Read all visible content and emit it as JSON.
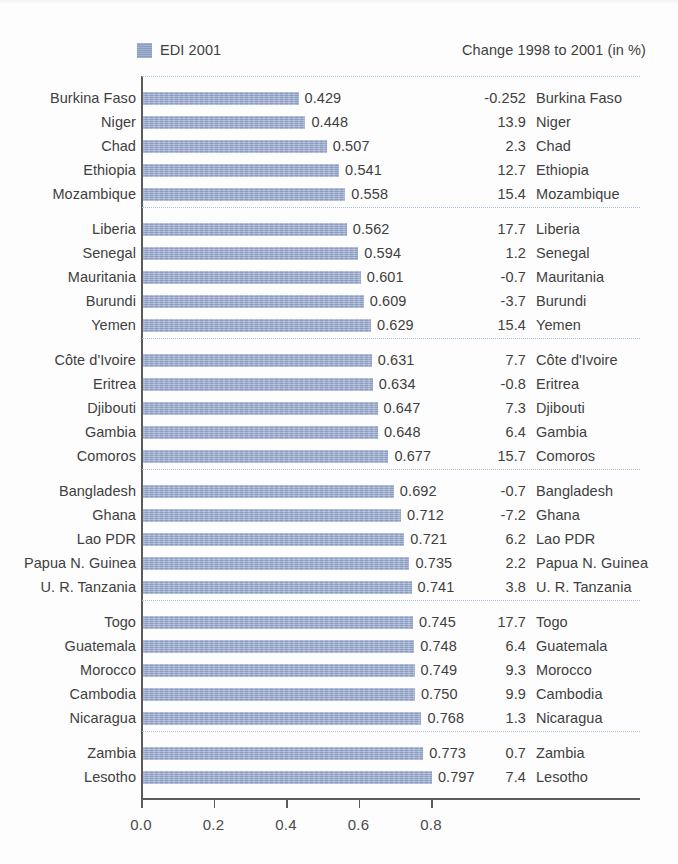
{
  "legend": {
    "label": "EDI 2001",
    "swatch_color": "#8a9cc2",
    "swatch_icon": "legend-square-icon"
  },
  "right_header": "Change 1998 to 2001 (in %)",
  "axis": {
    "ticks": [
      "0.0",
      "0.2",
      "0.4",
      "0.6",
      "0.8"
    ],
    "tick_values": [
      0.0,
      0.2,
      0.4,
      0.6,
      0.8
    ],
    "xmin": 0.0,
    "xmax": 1.0
  },
  "chart_data": {
    "type": "bar",
    "orientation": "horizontal",
    "title": "",
    "xlabel": "",
    "ylabel": "",
    "xlim": [
      0.0,
      1.0
    ],
    "grid": false,
    "legend_position": "top-left",
    "series": [
      {
        "name": "EDI 2001",
        "color": "#8a9cc2"
      }
    ],
    "value_columns": [
      "EDI 2001",
      "Change 1998 to 2001 (in %)"
    ],
    "groups": [
      {
        "rows": [
          {
            "category": "Burkina Faso",
            "value": 0.429,
            "value_label": "0.429",
            "change": -0.252,
            "change_label": "-0.252"
          },
          {
            "category": "Niger",
            "value": 0.448,
            "value_label": "0.448",
            "change": 13.9,
            "change_label": "13.9"
          },
          {
            "category": "Chad",
            "value": 0.507,
            "value_label": "0.507",
            "change": 2.3,
            "change_label": "2.3"
          },
          {
            "category": "Ethiopia",
            "value": 0.541,
            "value_label": "0.541",
            "change": 12.7,
            "change_label": "12.7"
          },
          {
            "category": "Mozambique",
            "value": 0.558,
            "value_label": "0.558",
            "change": 15.4,
            "change_label": "15.4"
          }
        ]
      },
      {
        "rows": [
          {
            "category": "Liberia",
            "value": 0.562,
            "value_label": "0.562",
            "change": 17.7,
            "change_label": "17.7"
          },
          {
            "category": "Senegal",
            "value": 0.594,
            "value_label": "0.594",
            "change": 1.2,
            "change_label": "1.2"
          },
          {
            "category": "Mauritania",
            "value": 0.601,
            "value_label": "0.601",
            "change": -0.7,
            "change_label": "-0.7"
          },
          {
            "category": "Burundi",
            "value": 0.609,
            "value_label": "0.609",
            "change": -3.7,
            "change_label": "-3.7"
          },
          {
            "category": "Yemen",
            "value": 0.629,
            "value_label": "0.629",
            "change": 15.4,
            "change_label": "15.4"
          }
        ]
      },
      {
        "rows": [
          {
            "category": "Côte d'Ivoire",
            "value": 0.631,
            "value_label": "0.631",
            "change": 7.7,
            "change_label": "7.7"
          },
          {
            "category": "Eritrea",
            "value": 0.634,
            "value_label": "0.634",
            "change": -0.8,
            "change_label": "-0.8"
          },
          {
            "category": "Djibouti",
            "value": 0.647,
            "value_label": "0.647",
            "change": 7.3,
            "change_label": "7.3"
          },
          {
            "category": "Gambia",
            "value": 0.648,
            "value_label": "0.648",
            "change": 6.4,
            "change_label": "6.4"
          },
          {
            "category": "Comoros",
            "value": 0.677,
            "value_label": "0.677",
            "change": 15.7,
            "change_label": "15.7"
          }
        ]
      },
      {
        "rows": [
          {
            "category": "Bangladesh",
            "value": 0.692,
            "value_label": "0.692",
            "change": -0.7,
            "change_label": "-0.7"
          },
          {
            "category": "Ghana",
            "value": 0.712,
            "value_label": "0.712",
            "change": -7.2,
            "change_label": "-7.2"
          },
          {
            "category": "Lao PDR",
            "value": 0.721,
            "value_label": "0.721",
            "change": 6.2,
            "change_label": "6.2"
          },
          {
            "category": "Papua N. Guinea",
            "value": 0.735,
            "value_label": "0.735",
            "change": 2.2,
            "change_label": "2.2"
          },
          {
            "category": "U. R. Tanzania",
            "value": 0.741,
            "value_label": "0.741",
            "change": 3.8,
            "change_label": "3.8"
          }
        ]
      },
      {
        "rows": [
          {
            "category": "Togo",
            "value": 0.745,
            "value_label": "0.745",
            "change": 17.7,
            "change_label": "17.7"
          },
          {
            "category": "Guatemala",
            "value": 0.748,
            "value_label": "0.748",
            "change": 6.4,
            "change_label": "6.4"
          },
          {
            "category": "Morocco",
            "value": 0.749,
            "value_label": "0.749",
            "change": 9.3,
            "change_label": "9.3"
          },
          {
            "category": "Cambodia",
            "value": 0.75,
            "value_label": "0.750",
            "change": 9.9,
            "change_label": "9.9"
          },
          {
            "category": "Nicaragua",
            "value": 0.768,
            "value_label": "0.768",
            "change": 1.3,
            "change_label": "1.3"
          }
        ]
      },
      {
        "rows": [
          {
            "category": "Zambia",
            "value": 0.773,
            "value_label": "0.773",
            "change": 0.7,
            "change_label": "0.7"
          },
          {
            "category": "Lesotho",
            "value": 0.797,
            "value_label": "0.797",
            "change": 7.4,
            "change_label": "7.4"
          }
        ]
      }
    ]
  }
}
